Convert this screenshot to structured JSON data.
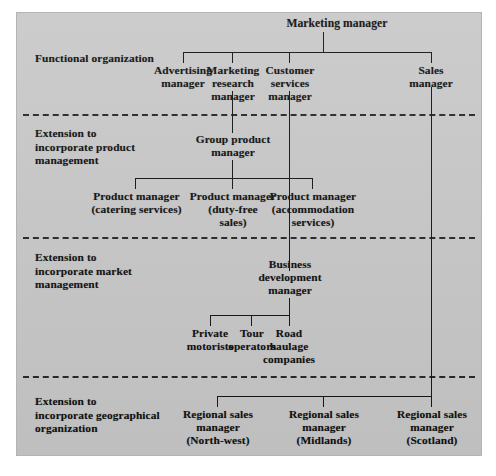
{
  "figure": {
    "type": "org-chart",
    "panel_color": "#c9c9c9",
    "line_color": "#161616",
    "bands": 4
  },
  "bands": [
    {
      "id": "functional",
      "label": "Functional organization"
    },
    {
      "id": "product",
      "label": "Extension to\nincorporate product\nmanagement"
    },
    {
      "id": "market",
      "label": "Extension to\nincorporate market\nmanagement"
    },
    {
      "id": "geographical",
      "label": "Extension to\nincorporate geographical\norganization"
    }
  ],
  "band_labels": {
    "functional": "Functional organization",
    "product_l1": "Extension to",
    "product_l2": "incorporate product",
    "product_l3": "management",
    "market_l1": "Extension to",
    "market_l2": "incorporate market",
    "market_l3": "management",
    "geo_l1": "Extension to",
    "geo_l2": "incorporate geographical",
    "geo_l3": "organization"
  },
  "nodes": {
    "root": {
      "label": "Marketing manager"
    },
    "functional": [
      {
        "id": "advertising",
        "l1": "Advertising",
        "l2": "manager",
        "l3": ""
      },
      {
        "id": "marketing-research",
        "l1": "Marketing",
        "l2": "research",
        "l3": "manager"
      },
      {
        "id": "customer-services",
        "l1": "Customer",
        "l2": "services",
        "l3": "manager"
      },
      {
        "id": "sales",
        "l1": "Sales",
        "l2": "manager",
        "l3": ""
      }
    ],
    "group_product": {
      "l1": "Group product",
      "l2": "manager"
    },
    "products": [
      {
        "id": "catering",
        "l1": "Product manager",
        "l2": "(catering services)",
        "l3": ""
      },
      {
        "id": "duty-free",
        "l1": "Product manager",
        "l2": "(duty-free",
        "l3": "sales)"
      },
      {
        "id": "accommodation",
        "l1": "Product manager",
        "l2": "(accommodation",
        "l3": "services)"
      }
    ],
    "business_development": {
      "l1": "Business",
      "l2": "development",
      "l3": "manager"
    },
    "markets": [
      {
        "id": "private-motorists",
        "l1": "Private",
        "l2": "motorists",
        "l3": ""
      },
      {
        "id": "tour-operators",
        "l1": "Tour",
        "l2": "operators",
        "l3": ""
      },
      {
        "id": "road-haulage",
        "l1": "Road",
        "l2": "haulage",
        "l3": "companies"
      }
    ],
    "regions": [
      {
        "id": "north-west",
        "l1": "Regional sales",
        "l2": "manager",
        "l3": "(North-west)"
      },
      {
        "id": "midlands",
        "l1": "Regional sales",
        "l2": "manager",
        "l3": "(Midlands)"
      },
      {
        "id": "scotland",
        "l1": "Regional sales",
        "l2": "manager",
        "l3": "(Scotland)"
      }
    ]
  }
}
